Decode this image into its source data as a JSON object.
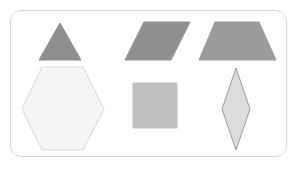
{
  "canvas": {
    "width": 298,
    "height": 174,
    "background_color": "#ffffff"
  },
  "card": {
    "name": "shapes-card",
    "x": 10,
    "y": 10,
    "width": 277,
    "height": 147,
    "background_color": "#ffffff",
    "border_color": "#d8d8d8",
    "border_radius": 11
  },
  "legend": {
    "rows": 2,
    "columns": 3,
    "shape_count": 6
  },
  "shapes": [
    {
      "id": "triangle",
      "label": "triangle",
      "row": 1,
      "column": 1,
      "fill": "#8e8e8e",
      "stroke": "#8e8e8e",
      "points": "60,23 81,60 39,60",
      "center_x": 60,
      "center_y": 47
    },
    {
      "id": "parallelogram",
      "label": "parallelogram",
      "row": 1,
      "column": 2,
      "fill": "#8f8f8f",
      "stroke": "#8f8f8f",
      "points": "144,22 190,22 171,60 125,60",
      "center_x": 157,
      "center_y": 41
    },
    {
      "id": "trapezoid",
      "label": "trapezoid",
      "row": 1,
      "column": 3,
      "fill": "#9b9b9b",
      "stroke": "#9b9b9b",
      "points": "215,22 259,22 276,60 199,60",
      "center_x": 237,
      "center_y": 41
    },
    {
      "id": "hexagon",
      "label": "hexagon",
      "row": 2,
      "column": 1,
      "fill": "#f5f5f5",
      "stroke": "#d5d5d5",
      "points": "42,67 83,67 104,109 83,150 42,150 22,109",
      "center_x": 63,
      "center_y": 109
    },
    {
      "id": "square",
      "label": "square",
      "row": 2,
      "column": 2,
      "fill": "#c0c0c0",
      "stroke": "#c0c0c0",
      "points": "133,83 177,83 177,128 133,128",
      "center_x": 155,
      "center_y": 105
    },
    {
      "id": "rhombus",
      "label": "rhombus",
      "row": 2,
      "column": 3,
      "fill": "#dcdcdc",
      "stroke": "#9a9a9a",
      "points": "236,68 250,109 236,150 222,109",
      "center_x": 236,
      "center_y": 109
    }
  ]
}
